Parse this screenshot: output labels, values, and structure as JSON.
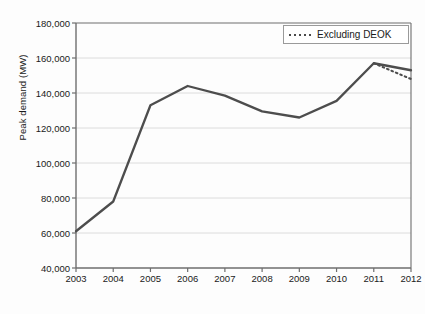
{
  "chart_data": {
    "type": "line",
    "title": "",
    "xlabel": "",
    "ylabel": "Peak demand (MW)",
    "categories": [
      "2003",
      "2004",
      "2005",
      "2006",
      "2007",
      "2008",
      "2009",
      "2010",
      "2011",
      "2012"
    ],
    "x": [
      2003,
      2004,
      2005,
      2006,
      2007,
      2008,
      2009,
      2010,
      2011,
      2012
    ],
    "ylim": [
      40000,
      180000
    ],
    "xlim": [
      2003,
      2012
    ],
    "yticks": [
      40000,
      60000,
      80000,
      100000,
      120000,
      140000,
      160000,
      180000
    ],
    "ytick_labels": [
      "40,000",
      "60,000",
      "80,000",
      "100,000",
      "120,000",
      "140,000",
      "160,000",
      "180,000"
    ],
    "grid": "horizontal",
    "legend_position": "top-right",
    "series": [
      {
        "name": "Peak demand",
        "style": "solid",
        "color": "#4d4d4d",
        "values": [
          61000,
          78000,
          133000,
          144000,
          138500,
          129500,
          126000,
          135500,
          157000,
          153000
        ]
      },
      {
        "name": "Excluding DEOK",
        "style": "dotted",
        "color": "#4d4d4d",
        "x": [
          2011,
          2012
        ],
        "values": [
          157000,
          148000
        ]
      }
    ],
    "annotations": []
  },
  "legend": {
    "entries": [
      {
        "label": "Excluding DEOK",
        "style": "dotted"
      }
    ]
  },
  "axis": {
    "y_title": "Peak demand (MW)",
    "y_tick_labels": [
      "180,000",
      "160,000",
      "140,000",
      "120,000",
      "100,000",
      "80,000",
      "60,000",
      "40,000"
    ],
    "x_tick_labels": [
      "2003",
      "2004",
      "2005",
      "2006",
      "2007",
      "2008",
      "2009",
      "2010",
      "2011",
      "2012"
    ]
  },
  "colors": {
    "line": "#4d4d4d",
    "grid": "#dcdcdc",
    "axis": "#6e6e6e",
    "text": "#1a1a1a"
  }
}
